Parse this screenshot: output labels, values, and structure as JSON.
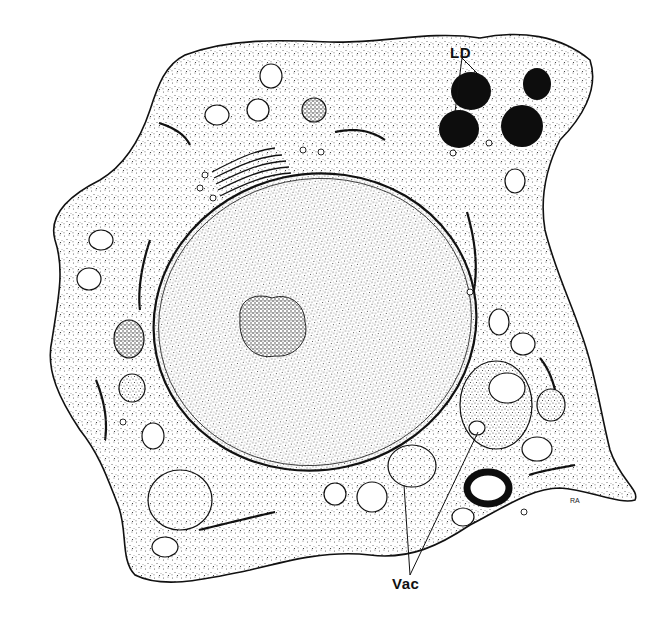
{
  "figure": {
    "type": "cell-ultrastructure-illustration",
    "style": "black ink stipple drawing on white",
    "colors": {
      "background": "#ffffff",
      "ink": "#111111",
      "cytoplasm_stipple": "#444444",
      "lipid_droplet_fill": "#0d0d0d"
    }
  },
  "labels": {
    "ld": "LD",
    "vac": "Vac",
    "signature": "RA"
  },
  "structures": {
    "cell": "irregular cell outline with stippled cytoplasm",
    "nucleus": "large oval nucleus with double envelope",
    "nucleolus": "dense granular nucleolus near nucleus center-left",
    "lipid_droplets": {
      "count": 4,
      "label_ref": "LD"
    },
    "vacuoles": {
      "count": 2,
      "label_ref": "Vac"
    },
    "golgi": "stacked cisternae upper left of nucleus",
    "mitochondria": "multiple elongated organelles with cristae",
    "er": "rough endoplasmic reticulum tubules with ribosomes",
    "ring_body": "black ring-shaped inclusion lower right"
  }
}
